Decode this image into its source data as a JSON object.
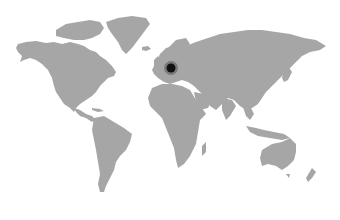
{
  "map": {
    "type": "world-map",
    "land_color": "#a6a6a6",
    "background_color": "#ffffff",
    "marker": {
      "label": "Central Europe",
      "x": 171,
      "y": 68,
      "color": "#111111",
      "halo_color": "#555555"
    }
  }
}
